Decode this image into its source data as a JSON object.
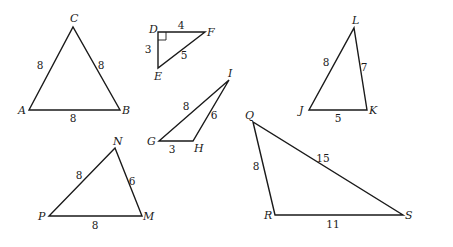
{
  "figure": {
    "triangles": [
      {
        "id": "ABC",
        "vertices": [
          {
            "name": "A",
            "x": 29,
            "y": 110,
            "lx": 18,
            "ly": 114
          },
          {
            "name": "B",
            "x": 120,
            "y": 110,
            "lx": 122,
            "ly": 114
          },
          {
            "name": "C",
            "x": 73,
            "y": 27,
            "lx": 70,
            "ly": 22
          }
        ],
        "sides": [
          {
            "label": "8",
            "between": "AC",
            "x": 40,
            "y": 69
          },
          {
            "label": "8",
            "between": "CB",
            "x": 101,
            "y": 69
          },
          {
            "label": "8",
            "between": "AB",
            "x": 73,
            "y": 122
          }
        ],
        "right_angle": null
      },
      {
        "id": "DEF",
        "vertices": [
          {
            "name": "D",
            "x": 158,
            "y": 32,
            "lx": 149,
            "ly": 33
          },
          {
            "name": "E",
            "x": 158,
            "y": 68,
            "lx": 154,
            "ly": 80
          },
          {
            "name": "F",
            "x": 205,
            "y": 32,
            "lx": 207,
            "ly": 36
          }
        ],
        "sides": [
          {
            "label": "4",
            "between": "DF",
            "x": 181,
            "y": 29
          },
          {
            "label": "3",
            "between": "DE",
            "x": 148,
            "y": 53
          },
          {
            "label": "5",
            "between": "EF",
            "x": 184,
            "y": 59
          }
        ],
        "right_angle": {
          "at": "D",
          "size": 8
        }
      },
      {
        "id": "GHI",
        "vertices": [
          {
            "name": "G",
            "x": 159,
            "y": 141,
            "lx": 147,
            "ly": 145
          },
          {
            "name": "H",
            "x": 193,
            "y": 141,
            "lx": 194,
            "ly": 152
          },
          {
            "name": "I",
            "x": 229,
            "y": 80,
            "lx": 228,
            "ly": 77
          }
        ],
        "sides": [
          {
            "label": "8",
            "between": "GI",
            "x": 186,
            "y": 110
          },
          {
            "label": "6",
            "between": "HI",
            "x": 214,
            "y": 119
          },
          {
            "label": "3",
            "between": "GH",
            "x": 172,
            "y": 153
          }
        ],
        "right_angle": null
      },
      {
        "id": "JKL",
        "vertices": [
          {
            "name": "J",
            "x": 309,
            "y": 110,
            "lx": 299,
            "ly": 114
          },
          {
            "name": "K",
            "x": 367,
            "y": 110,
            "lx": 369,
            "ly": 114
          },
          {
            "name": "L",
            "x": 354,
            "y": 28,
            "lx": 352,
            "ly": 24
          }
        ],
        "sides": [
          {
            "label": "8",
            "between": "JL",
            "x": 326,
            "y": 66
          },
          {
            "label": "7",
            "between": "LK",
            "x": 364,
            "y": 71
          },
          {
            "label": "5",
            "between": "JK",
            "x": 338,
            "y": 122
          }
        ],
        "right_angle": null
      },
      {
        "id": "MNP",
        "vertices": [
          {
            "name": "P",
            "x": 49,
            "y": 216,
            "lx": 38,
            "ly": 220
          },
          {
            "name": "M",
            "x": 142,
            "y": 216,
            "lx": 143,
            "ly": 220
          },
          {
            "name": "N",
            "x": 115,
            "y": 148,
            "lx": 113,
            "ly": 145
          }
        ],
        "sides": [
          {
            "label": "8",
            "between": "PN",
            "x": 79,
            "y": 179
          },
          {
            "label": "6",
            "between": "NM",
            "x": 132,
            "y": 185
          },
          {
            "label": "8",
            "between": "PM",
            "x": 95,
            "y": 229
          }
        ],
        "right_angle": null
      },
      {
        "id": "QRS",
        "vertices": [
          {
            "name": "Q",
            "x": 253,
            "y": 122,
            "lx": 245,
            "ly": 119
          },
          {
            "name": "R",
            "x": 275,
            "y": 215,
            "lx": 264,
            "ly": 219
          },
          {
            "name": "S",
            "x": 403,
            "y": 215,
            "lx": 405,
            "ly": 219
          }
        ],
        "sides": [
          {
            "label": "8",
            "between": "QR",
            "x": 256,
            "y": 170
          },
          {
            "label": "15",
            "between": "QS",
            "x": 323,
            "y": 162
          },
          {
            "label": "11",
            "between": "RS",
            "x": 333,
            "y": 228
          }
        ],
        "right_angle": null
      }
    ]
  }
}
